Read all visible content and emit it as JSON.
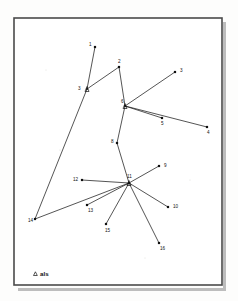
{
  "figure": {
    "background_color": "#fdfdfc",
    "frame": {
      "stroke_color": "#4a4a4a",
      "x": 14,
      "y": 18,
      "width": 208,
      "height": 267
    },
    "legend": {
      "marker": "triangle",
      "marker_name": "triangle-marker",
      "label": "als"
    }
  },
  "chart_data": {
    "type": "scatter",
    "title": "",
    "xlabel": "",
    "ylabel": "",
    "grid": false,
    "legend_position": "bottom-left",
    "legend_entries": [
      {
        "marker": "triangle",
        "label": "als"
      }
    ],
    "xlim": [
      14,
      222
    ],
    "ylim": [
      18,
      285
    ],
    "nodes": [
      {
        "id": "1",
        "label": "1",
        "x": 95,
        "y": 47,
        "marker": "dot",
        "label_dx": -6,
        "label_dy": -1
      },
      {
        "id": "2",
        "label": "2",
        "x": 119,
        "y": 67,
        "marker": "dot",
        "label_dx": -1,
        "label_dy": -4
      },
      {
        "id": "3r",
        "label": "3",
        "x": 175,
        "y": 72,
        "marker": "dot",
        "label_dx": 5,
        "label_dy": 0
      },
      {
        "id": "3l",
        "label": "3",
        "x": 87,
        "y": 89,
        "marker": "triangle",
        "label_dx": -9,
        "label_dy": 1
      },
      {
        "id": "6",
        "label": "6",
        "x": 125,
        "y": 106,
        "marker": "triangle",
        "label_dx": -4,
        "label_dy": -3
      },
      {
        "id": "5",
        "label": "5",
        "x": 162,
        "y": 118,
        "marker": "dot",
        "label_dx": -1,
        "label_dy": 7
      },
      {
        "id": "4",
        "label": "4",
        "x": 207,
        "y": 127,
        "marker": "dot",
        "label_dx": 0,
        "label_dy": 7
      },
      {
        "id": "8",
        "label": "8",
        "x": 117,
        "y": 143,
        "marker": "dot",
        "label_dx": -6,
        "label_dy": 0
      },
      {
        "id": "11",
        "label": "11",
        "x": 129,
        "y": 183,
        "marker": "triangle",
        "label_dx": -2,
        "label_dy": -5
      },
      {
        "id": "9",
        "label": "9",
        "x": 159,
        "y": 166,
        "marker": "dot",
        "label_dx": 5,
        "label_dy": 1
      },
      {
        "id": "12",
        "label": "12",
        "x": 82,
        "y": 180,
        "marker": "dot",
        "label_dx": -9,
        "label_dy": 1
      },
      {
        "id": "10",
        "label": "10",
        "x": 168,
        "y": 207,
        "marker": "dot",
        "label_dx": 5,
        "label_dy": 1
      },
      {
        "id": "13",
        "label": "13",
        "x": 87,
        "y": 205,
        "marker": "dot",
        "label_dx": 1,
        "label_dy": 7
      },
      {
        "id": "15",
        "label": "15",
        "x": 106,
        "y": 224,
        "marker": "dot",
        "label_dx": -1,
        "label_dy": 8
      },
      {
        "id": "16",
        "label": "16",
        "x": 159,
        "y": 243,
        "marker": "dot",
        "label_dx": 1,
        "label_dy": 7
      },
      {
        "id": "14",
        "label": "14",
        "x": 35,
        "y": 219,
        "marker": "dot",
        "label_dx": -7,
        "label_dy": 3
      }
    ],
    "edges": [
      {
        "from": "1",
        "to": "3l"
      },
      {
        "from": "2",
        "to": "3l"
      },
      {
        "from": "2",
        "to": "6"
      },
      {
        "from": "3l",
        "to": "14"
      },
      {
        "from": "3r",
        "to": "6"
      },
      {
        "from": "6",
        "to": "5"
      },
      {
        "from": "6",
        "to": "4"
      },
      {
        "from": "6",
        "to": "8"
      },
      {
        "from": "8",
        "to": "11"
      },
      {
        "from": "11",
        "to": "9"
      },
      {
        "from": "11",
        "to": "12"
      },
      {
        "from": "11",
        "to": "10"
      },
      {
        "from": "11",
        "to": "13"
      },
      {
        "from": "11",
        "to": "15"
      },
      {
        "from": "11",
        "to": "16"
      },
      {
        "from": "11",
        "to": "14"
      }
    ]
  }
}
